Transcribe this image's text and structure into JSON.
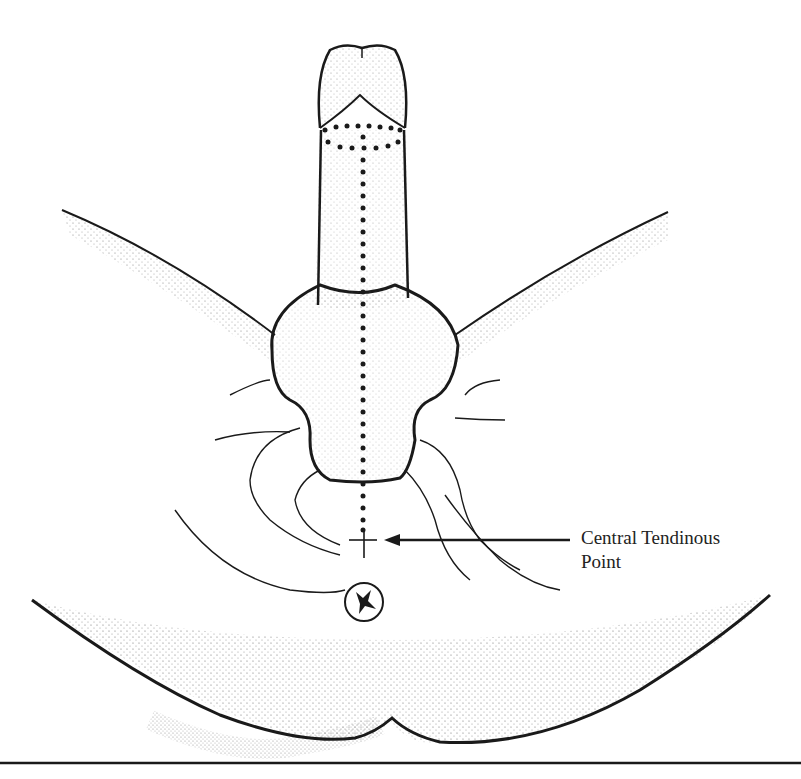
{
  "figure": {
    "type": "anatomical line illustration",
    "annotation": {
      "line1": "Central Tendinous",
      "line2": "Point",
      "arrow_target": "central tendinous point marker"
    },
    "colors": {
      "ink": "#1a1a1a",
      "background": "#ffffff"
    }
  }
}
